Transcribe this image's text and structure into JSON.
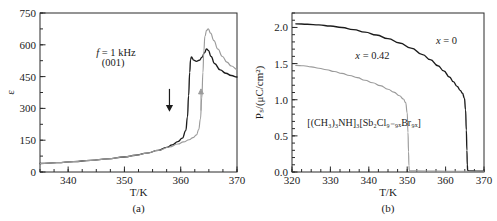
{
  "figure": {
    "panels": [
      {
        "id": "a",
        "caption": "(a)",
        "xlabel": "T/K",
        "ylabel": "ε",
        "annotations": [
          "f = 1 kHz",
          "(001)"
        ],
        "arrow_cooling": "down-arrow-icon",
        "arrow_heating": "up-arrow-icon"
      },
      {
        "id": "b",
        "caption": "(b)",
        "xlabel": "T/K",
        "ylabel": "Pₛ/(μC/cm²)",
        "series_labels": [
          "x = 0",
          "x = 0.42"
        ],
        "formula": "[(CH₃)₃NH]₃[Sb₂Cl₉₋₉ₓBr₉ₓ]"
      }
    ]
  },
  "chart_data": [
    {
      "type": "line",
      "panel": "a",
      "title": "",
      "xlabel": "T/K",
      "ylabel": "ε",
      "xlim": [
        335,
        370
      ],
      "ylim": [
        0,
        750
      ],
      "xticks": [
        340,
        350,
        360,
        370
      ],
      "yticks": [
        0,
        150,
        300,
        450,
        600,
        750
      ],
      "xminor_step": 2.5,
      "yminor_step": 75,
      "grid": false,
      "legend": "none",
      "annotations": [
        {
          "text": "f = 1 kHz",
          "x": 348.5,
          "y": 545
        },
        {
          "text": "(001)",
          "x": 348.0,
          "y": 500
        },
        {
          "text": "down-arrow",
          "x": 358.0,
          "y": 340
        },
        {
          "text": "up-arrow",
          "x": 363.6,
          "y": 340
        }
      ],
      "series": [
        {
          "name": "cooling",
          "color": "#1c1c1c",
          "points": [
            [
              335,
              40
            ],
            [
              338,
              44
            ],
            [
              341,
              49
            ],
            [
              344,
              55
            ],
            [
              347,
              62
            ],
            [
              350,
              71
            ],
            [
              352,
              79
            ],
            [
              354,
              89
            ],
            [
              356,
              102
            ],
            [
              357.5,
              116
            ],
            [
              358.5,
              128
            ],
            [
              359.5,
              143
            ],
            [
              360.3,
              160
            ],
            [
              360.9,
              195
            ],
            [
              361.2,
              260
            ],
            [
              361.4,
              360
            ],
            [
              361.6,
              470
            ],
            [
              361.75,
              530
            ],
            [
              361.9,
              543
            ],
            [
              362.3,
              528
            ],
            [
              362.8,
              522
            ],
            [
              363.3,
              527
            ],
            [
              363.8,
              542
            ],
            [
              364.2,
              562
            ],
            [
              364.6,
              580
            ],
            [
              364.9,
              574
            ],
            [
              365.4,
              545
            ],
            [
              366,
              512
            ],
            [
              367,
              482
            ],
            [
              368,
              466
            ],
            [
              369,
              455
            ],
            [
              370,
              448
            ]
          ]
        },
        {
          "name": "heating",
          "color": "#9b9b9b",
          "points": [
            [
              335,
              40
            ],
            [
              338,
              44
            ],
            [
              341,
              49
            ],
            [
              344,
              55
            ],
            [
              347,
              62
            ],
            [
              350,
              71
            ],
            [
              352,
              79
            ],
            [
              354,
              89
            ],
            [
              356,
              102
            ],
            [
              358,
              118
            ],
            [
              359.5,
              132
            ],
            [
              360.5,
              142
            ],
            [
              361.5,
              152
            ],
            [
              362.2,
              162
            ],
            [
              362.8,
              175
            ],
            [
              363.2,
              200
            ],
            [
              363.5,
              250
            ],
            [
              363.75,
              350
            ],
            [
              363.95,
              470
            ],
            [
              364.1,
              570
            ],
            [
              364.3,
              640
            ],
            [
              364.6,
              668
            ],
            [
              364.9,
              675
            ],
            [
              365.3,
              655
            ],
            [
              365.9,
              620
            ],
            [
              366.6,
              580
            ],
            [
              367.4,
              545
            ],
            [
              368.2,
              518
            ],
            [
              369,
              500
            ],
            [
              370,
              484
            ]
          ]
        }
      ]
    },
    {
      "type": "line",
      "panel": "b",
      "title": "",
      "xlabel": "T/K",
      "ylabel": "Pₛ/(μC/cm²)",
      "xlim": [
        320,
        370
      ],
      "ylim": [
        0.0,
        2.2
      ],
      "xticks": [
        320,
        330,
        340,
        350,
        360,
        370
      ],
      "yticks": [
        0.0,
        0.5,
        1.0,
        1.5,
        2.0
      ],
      "xminor_step": 2.5,
      "yminor_step": 0.1,
      "grid": false,
      "legend": "inline-labels",
      "annotations": [
        {
          "text": "x = 0",
          "x": 357.5,
          "y": 1.77
        },
        {
          "text": "x = 0.42",
          "x": 336.5,
          "y": 1.56
        },
        {
          "text": "[(CH₃)₃NH]₃[Sb₂Cl₉₋₉ₓBr₉ₓ]",
          "x": 324.0,
          "y": 0.63
        }
      ],
      "series": [
        {
          "name": "x = 0",
          "color": "#1c1c1c",
          "points": [
            [
              321.0,
              2.05
            ],
            [
              324,
              2.045
            ],
            [
              327,
              2.035
            ],
            [
              330,
              2.02
            ],
            [
              333,
              2.0
            ],
            [
              336,
              1.97
            ],
            [
              339,
              1.935
            ],
            [
              342,
              1.895
            ],
            [
              345,
              1.845
            ],
            [
              348,
              1.785
            ],
            [
              351,
              1.715
            ],
            [
              354,
              1.625
            ],
            [
              356,
              1.555
            ],
            [
              358,
              1.47
            ],
            [
              359.5,
              1.4
            ],
            [
              361,
              1.315
            ],
            [
              362,
              1.25
            ],
            [
              363,
              1.185
            ],
            [
              363.8,
              1.13
            ],
            [
              364.4,
              1.09
            ],
            [
              364.9,
              1.02
            ],
            [
              365.2,
              0.86
            ],
            [
              365.4,
              0.58
            ],
            [
              365.55,
              0.3
            ],
            [
              365.65,
              0.1
            ],
            [
              365.75,
              0.02
            ],
            [
              366.2,
              0.015
            ],
            [
              368,
              0.012
            ],
            [
              370,
              0.01
            ]
          ]
        },
        {
          "name": "x = 0.42",
          "color": "#9b9b9b",
          "points": [
            [
              321.0,
              1.475
            ],
            [
              323,
              1.47
            ],
            [
              325,
              1.455
            ],
            [
              327,
              1.435
            ],
            [
              329,
              1.415
            ],
            [
              331,
              1.39
            ],
            [
              333,
              1.365
            ],
            [
              335,
              1.335
            ],
            [
              337,
              1.305
            ],
            [
              339,
              1.27
            ],
            [
              341,
              1.235
            ],
            [
              343,
              1.195
            ],
            [
              345,
              1.145
            ],
            [
              346.5,
              1.105
            ],
            [
              348,
              1.055
            ],
            [
              349,
              1.01
            ],
            [
              349.6,
              0.96
            ],
            [
              350.0,
              0.82
            ],
            [
              350.2,
              0.55
            ],
            [
              350.35,
              0.28
            ],
            [
              350.45,
              0.09
            ],
            [
              350.55,
              0.02
            ],
            [
              352,
              0.015
            ],
            [
              358,
              0.012
            ],
            [
              364,
              0.01
            ],
            [
              370,
              0.01
            ]
          ]
        }
      ]
    }
  ]
}
